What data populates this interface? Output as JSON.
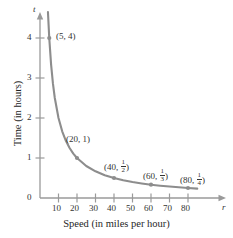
{
  "chart_data": {
    "type": "line",
    "title": "",
    "subtitle": "",
    "xlabel": "Speed (in miles per hour)",
    "ylabel": "Time (in hours)",
    "x_axis_variable": "r",
    "y_axis_variable": "t",
    "relation": "t = 20/r",
    "xlim": [
      0,
      88
    ],
    "ylim": [
      0,
      4.6
    ],
    "grid": false,
    "legend": "none",
    "x_ticks": [
      10,
      20,
      30,
      40,
      50,
      60,
      70,
      80
    ],
    "x_tick_labels": [
      "10",
      "20",
      "30",
      "40",
      "50",
      "60",
      "70",
      "80"
    ],
    "y_ticks": [
      0,
      1,
      2,
      3,
      4
    ],
    "y_tick_labels": [
      "0",
      "1",
      "2",
      "3",
      "4"
    ],
    "curve_color": "#8d8d8d",
    "axis_color": "#9a9a9a",
    "text_color": "#333333",
    "series": [
      {
        "name": "t = 20/r",
        "x": [
          4.3,
          5,
          6,
          7,
          8,
          10,
          12,
          14,
          16,
          18,
          20,
          25,
          30,
          35,
          40,
          45,
          50,
          55,
          60,
          65,
          70,
          75,
          80,
          85
        ],
        "values": [
          4.65,
          4,
          3.333,
          2.857,
          2.5,
          2,
          1.667,
          1.429,
          1.25,
          1.111,
          1,
          0.8,
          0.667,
          0.571,
          0.5,
          0.444,
          0.4,
          0.364,
          0.333,
          0.308,
          0.286,
          0.267,
          0.25,
          0.235
        ]
      }
    ],
    "labeled_points": [
      {
        "x": 5,
        "y": 4,
        "label_x": "5",
        "label_y": "4",
        "label_y_num": "",
        "label_y_den": "",
        "is_fraction": false,
        "text": "(5, 4)"
      },
      {
        "x": 20,
        "y": 1,
        "label_x": "20",
        "label_y": "1",
        "label_y_num": "",
        "label_y_den": "",
        "is_fraction": false,
        "text": "(20, 1)"
      },
      {
        "x": 40,
        "y": 0.5,
        "label_x": "40",
        "label_y": "",
        "label_y_num": "1",
        "label_y_den": "2",
        "is_fraction": true,
        "text": "(40, 1/2)"
      },
      {
        "x": 60,
        "y": 0.3333,
        "label_x": "60",
        "label_y": "",
        "label_y_num": "1",
        "label_y_den": "3",
        "is_fraction": true,
        "text": "(60, 1/3)"
      },
      {
        "x": 80,
        "y": 0.25,
        "label_x": "80",
        "label_y": "",
        "label_y_num": "1",
        "label_y_den": "4",
        "is_fraction": true,
        "text": "(80, 1/4)"
      }
    ]
  },
  "axes": {
    "x_title": "Speed (in miles per hour)",
    "y_title": "Time (in hours)",
    "x_var": "r",
    "y_var": "t",
    "x_tick_labels": [
      "10",
      "20",
      "30",
      "40",
      "50",
      "60",
      "70",
      "80"
    ],
    "y_tick_labels": [
      "4",
      "3",
      "2",
      "1",
      "0"
    ]
  },
  "point_labels": {
    "p1": "(5, 4)",
    "p2": "(20, 1)",
    "p3_open": "(40, ",
    "p3_num": "1",
    "p3_den": "2",
    "p3_close": ")",
    "p4_open": "(60, ",
    "p4_num": "1",
    "p4_den": "3",
    "p4_close": ")",
    "p5_open": "(80, ",
    "p5_num": "1",
    "p5_den": "4",
    "p5_close": ")"
  }
}
